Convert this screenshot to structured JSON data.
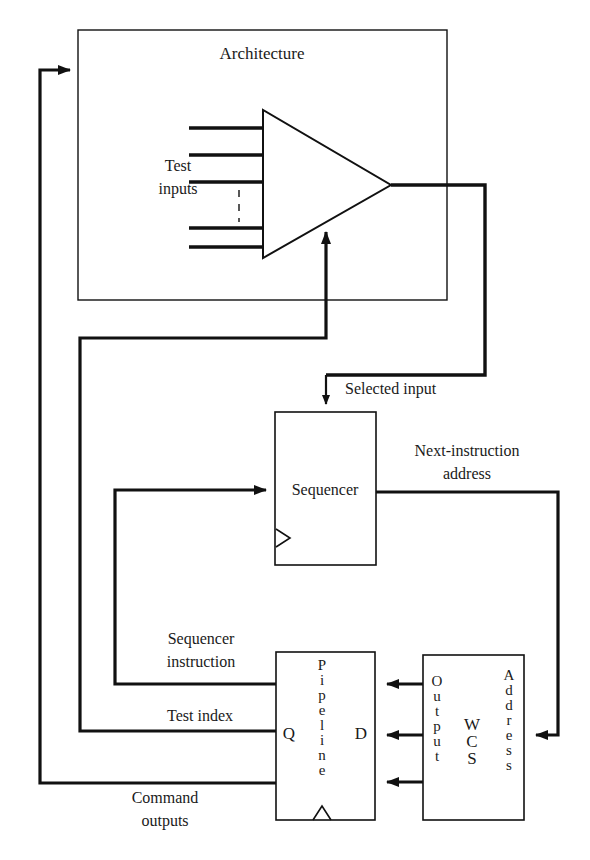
{
  "figure": {
    "type": "block-diagram",
    "domain": "computer-architecture",
    "stroke_color": "#111111",
    "background_color": "#ffffff"
  },
  "blocks": {
    "architecture": {
      "label": "Architecture"
    },
    "mux": {
      "label": ""
    },
    "sequencer": {
      "label": "Sequencer"
    },
    "pipeline": {
      "label_vertical": [
        "P",
        "i",
        "p",
        "e",
        "l",
        "i",
        "n",
        "e"
      ],
      "port_q": "Q",
      "port_d": "D"
    },
    "wcs": {
      "label_vertical": [
        "W",
        "C",
        "S"
      ],
      "port_output_vertical": [
        "O",
        "u",
        "t",
        "p",
        "u",
        "t"
      ],
      "port_address_vertical": [
        "A",
        "d",
        "d",
        "r",
        "e",
        "s",
        "s"
      ]
    }
  },
  "labels": {
    "test_inputs_line1": "Test",
    "test_inputs_line2": "inputs",
    "selected_input": "Selected input",
    "next_instruction_line1": "Next-instruction",
    "next_instruction_line2": "address",
    "sequencer_instruction_line1": "Sequencer",
    "sequencer_instruction_line2": "instruction",
    "test_index": "Test index",
    "command_outputs_line1": "Command",
    "command_outputs_line2": "outputs"
  },
  "signals": [
    {
      "name": "test-inputs",
      "from": "external",
      "to": "mux",
      "count": 5
    },
    {
      "name": "selected-input",
      "from": "mux",
      "to": "sequencer"
    },
    {
      "name": "next-instruction-address",
      "from": "sequencer",
      "to": "wcs-address"
    },
    {
      "name": "wcs-output-to-pipeline-d",
      "from": "wcs-output",
      "to": "pipeline-d",
      "count": 3
    },
    {
      "name": "sequencer-instruction",
      "from": "pipeline-q",
      "to": "sequencer"
    },
    {
      "name": "test-index",
      "from": "pipeline-q",
      "to": "mux-select"
    },
    {
      "name": "command-outputs",
      "from": "pipeline-q",
      "to": "architecture"
    }
  ]
}
